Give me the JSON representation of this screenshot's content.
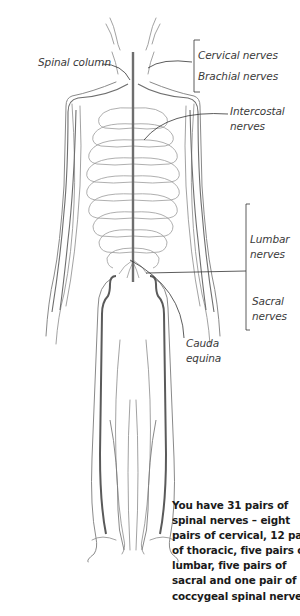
{
  "figure": {
    "labels": {
      "spinal_column": "Spinal column",
      "cervical": "Cervical nerves",
      "brachial": "Brachial nerves",
      "intercostal": [
        "Intercostal",
        "nerves"
      ],
      "lumbar": [
        "Lumbar",
        "nerves"
      ],
      "sacral": [
        "Sacral",
        "nerves"
      ],
      "cauda_equina": [
        "Cauda",
        "equina"
      ]
    },
    "caption_lines": [
      "You have 31 pairs of",
      "spinal nerves – eight",
      "pairs of cervical, 12 pairs",
      "of thoracic, five pairs of",
      "lumbar, five pairs of",
      "sacral and one pair of",
      "coccygeal spinal nerves."
    ],
    "colors": {
      "nerve": "#6e6e6e",
      "nerve_dark": "#4a4a4a",
      "outline": "#8a8a8a",
      "text": "#1a1a1a",
      "label": "#3a3a3a"
    }
  }
}
